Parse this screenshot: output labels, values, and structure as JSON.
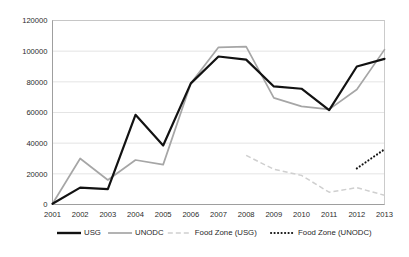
{
  "chart_data": {
    "type": "line",
    "title": "",
    "subtitle": "",
    "xlabel": "",
    "ylabel": "",
    "categories": [
      "2001",
      "2002",
      "2003",
      "2004",
      "2005",
      "2006",
      "2007",
      "2008",
      "2009",
      "2010",
      "2011",
      "2012",
      "2013"
    ],
    "x": [
      2001,
      2002,
      2003,
      2004,
      2005,
      2006,
      2007,
      2008,
      2009,
      2010,
      2011,
      2012,
      2013
    ],
    "ylim": [
      0,
      120000
    ],
    "xlim": [
      2001,
      2013
    ],
    "yticks": [
      0,
      20000,
      40000,
      60000,
      80000,
      100000,
      120000
    ],
    "ytick_labels": [
      "0",
      "20000",
      "40000",
      "60000",
      "80000",
      "100000",
      "120000"
    ],
    "grid": true,
    "legend_position": "bottom",
    "series": [
      {
        "name": "USG",
        "style": "solid-thick-black",
        "color": "#121212",
        "values": [
          500,
          11000,
          10000,
          58500,
          38500,
          79000,
          96500,
          94500,
          77000,
          75500,
          61500,
          90000,
          95000
        ]
      },
      {
        "name": "UNODC",
        "style": "solid-gray",
        "color": "#a6a6a6",
        "values": [
          500,
          30000,
          16000,
          29000,
          26000,
          79000,
          102500,
          103000,
          69500,
          64000,
          62000,
          75000,
          101000
        ]
      },
      {
        "name": "Food Zone (USG)",
        "style": "dashed-light-gray",
        "color": "#cfcfcf",
        "values": [
          null,
          null,
          null,
          null,
          null,
          null,
          null,
          32000,
          23000,
          19000,
          8000,
          11000,
          6000
        ]
      },
      {
        "name": "Food Zone (UNODC)",
        "style": "dotted-black",
        "color": "#111111",
        "values": [
          null,
          null,
          null,
          null,
          null,
          null,
          null,
          null,
          null,
          null,
          null,
          23500,
          36000
        ]
      }
    ]
  },
  "legend": {
    "items": [
      {
        "label": "USG"
      },
      {
        "label": "UNODC"
      },
      {
        "label": "Food Zone (USG)"
      },
      {
        "label": "Food Zone (UNODC)"
      }
    ]
  }
}
